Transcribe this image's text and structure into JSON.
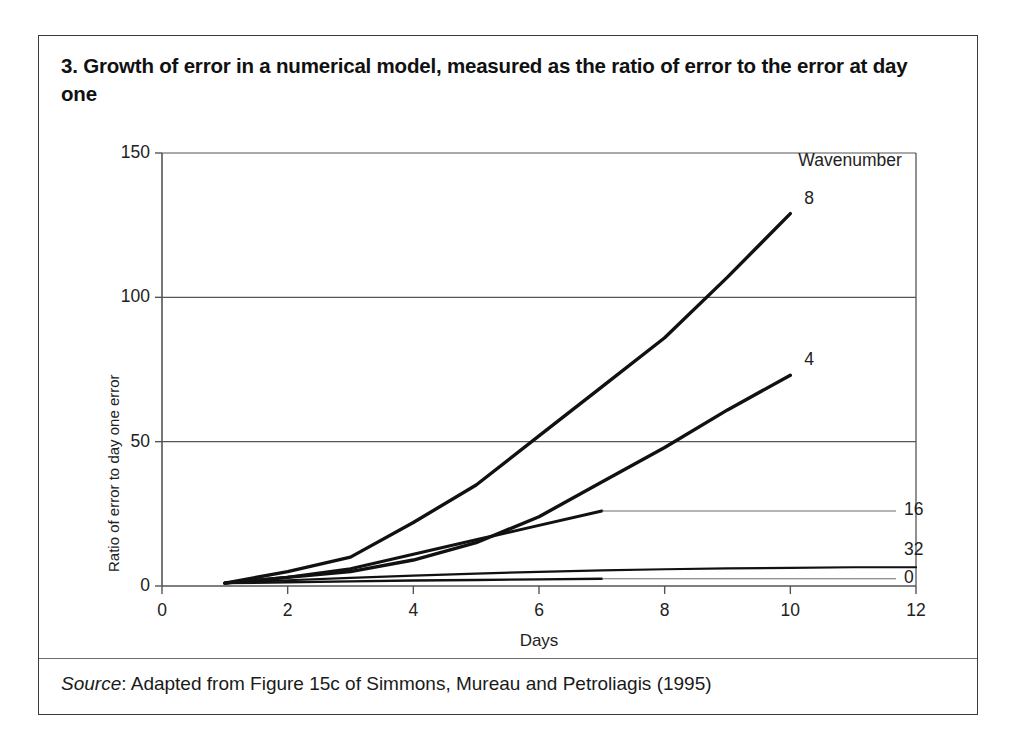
{
  "figure": {
    "title": "3.  Growth of error in a numerical model, measured as the ratio of error to the error at day one",
    "source_prefix": "Source",
    "source_text": ": Adapted from Figure 15c of Simmons, Mureau and Petroliagis (1995)"
  },
  "chart_data": {
    "type": "line",
    "title": "Growth of error in a numerical model, measured as the ratio of error to the error at day one",
    "xlabel": "Days",
    "ylabel": "Ratio of error to day one error",
    "xlim": [
      0,
      12
    ],
    "ylim": [
      0,
      150
    ],
    "xticks": [
      "0",
      "2",
      "4",
      "6",
      "8",
      "10",
      "12"
    ],
    "yticks": [
      "0",
      "50",
      "100",
      "150"
    ],
    "grid": "horizontal",
    "legend_position": "right-inline",
    "legend_title": "Wavenumber",
    "series": [
      {
        "name": "8",
        "label": "8",
        "color": "#111111",
        "width": 3.4,
        "x": [
          1,
          2,
          3,
          4,
          5,
          6,
          7,
          8,
          9,
          10
        ],
        "y": [
          1,
          5,
          10,
          22,
          35,
          52,
          69,
          86,
          107,
          129
        ]
      },
      {
        "name": "4",
        "label": "4",
        "color": "#111111",
        "width": 3.4,
        "x": [
          1,
          2,
          3,
          4,
          5,
          6,
          7,
          8,
          9,
          10
        ],
        "y": [
          1,
          3,
          5,
          9,
          15,
          24,
          36,
          48,
          61,
          73
        ]
      },
      {
        "name": "16",
        "label": "16",
        "color": "#111111",
        "width": 3.0,
        "x": [
          1,
          2,
          3,
          4,
          5,
          6,
          7
        ],
        "y": [
          1,
          3,
          6,
          11,
          16,
          21,
          26
        ],
        "leader_to_x": 12,
        "leader_y": 26
      },
      {
        "name": "32",
        "label": "32",
        "color": "#111111",
        "width": 2.2,
        "x": [
          1,
          2,
          3,
          4,
          5,
          6,
          7,
          8,
          9,
          10,
          11,
          12
        ],
        "y": [
          1,
          2,
          2.8,
          3.6,
          4.3,
          4.9,
          5.4,
          5.8,
          6.1,
          6.3,
          6.5,
          6.5
        ]
      },
      {
        "name": "0",
        "label": "0",
        "color": "#111111",
        "width": 2.4,
        "x": [
          1,
          2,
          3,
          4,
          5,
          6,
          7
        ],
        "y": [
          1,
          1.3,
          1.6,
          1.9,
          2.1,
          2.3,
          2.5
        ],
        "leader_to_x": 12,
        "leader_y": 2.5
      }
    ]
  }
}
